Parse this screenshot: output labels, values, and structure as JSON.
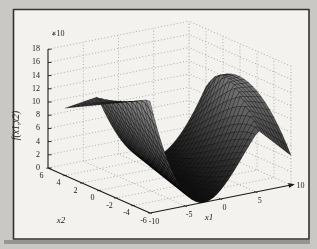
{
  "page": {
    "background": "#c9c8c4",
    "frame_border": "#32322f",
    "plot_background": "#f3f2ee",
    "page_shadow": "#96958f",
    "grid_color": "#9b9a95",
    "axis_color": "#1c1c1a",
    "text_color": "#1b1b18"
  },
  "chart_data": {
    "type": "surface",
    "title": "",
    "xlabel": "x1",
    "ylabel": "x2",
    "zlabel": "f(x1,x2)",
    "z_exponent": {
      "base": "×10",
      "power": "4"
    },
    "axes_ranges": {
      "x1": [
        -10,
        10
      ],
      "x2": [
        -6,
        6
      ],
      "z_e4": [
        0,
        18
      ]
    },
    "x1_ticks": {
      "values": [
        -10,
        -5,
        0,
        5,
        10
      ],
      "labels": [
        "-10",
        "-5",
        "0",
        "5",
        "10"
      ]
    },
    "x2_ticks": {
      "values": [
        6,
        4,
        2,
        0,
        -2,
        -4,
        -6
      ],
      "labels": [
        "6",
        "4",
        "2",
        "0",
        "-2",
        "-4",
        "-6"
      ]
    },
    "z_ticks": {
      "values_e4": [
        0,
        2,
        4,
        6,
        8,
        10,
        12,
        14,
        16,
        18
      ],
      "labels": [
        "0",
        "2",
        "4",
        "6",
        "8",
        "10",
        "12",
        "14",
        "16",
        "18"
      ]
    },
    "grid_style": "dotted",
    "x1_axis_arrow": true,
    "legend": null,
    "surface": {
      "x1_domain": [
        -10,
        10
      ],
      "x2_domain": [
        -6,
        4
      ],
      "mesh": {
        "nx": 40,
        "ny": 20
      },
      "z_unit": "1e4",
      "z_min_e4": 0,
      "z_max_e4": 17.2,
      "valley": "flat-bottomed trough with z near 0 running roughly along x1 = 0.47*(x2+1); steep quadratic walls saturating into high plateaus (~1.0e5 to 1.7e5) at the outer edges; highest rim at front-left (x1=-10,x2=-6), back-right wall peaks ~1.3e5, drooping to ~0.45e5 at (x1=10,x2=-6)",
      "z_model": {
        "cos_r": 0.906,
        "sin_r": 0.423,
        "x2_shift": 1,
        "wall_u": 7,
        "wall_power": 2,
        "g_const": 13,
        "g_x2": -0.3,
        "g_x1x2": 0.04,
        "d_front": 0.22,
        "d_back": 0.25,
        "z_clamp_e4": [
          0,
          18
        ]
      },
      "colormap": {
        "low_z_color": "#101010",
        "high_z_color": "#969696"
      },
      "edge_color": "rgba(0,0,0,0.5)"
    }
  }
}
